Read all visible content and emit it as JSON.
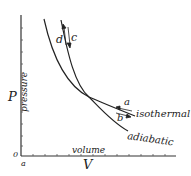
{
  "diagram": {
    "axes": {
      "y_label": "pressure",
      "y_symbol": "P",
      "x_label": "volume",
      "x_symbol": "V",
      "origin": "0",
      "x_origin_label": "a"
    },
    "curves": [
      {
        "name": "isothermal",
        "label": "isothermal"
      },
      {
        "name": "adiabatic",
        "label": "adiabatic"
      }
    ],
    "arrows": {
      "a": "a",
      "b": "b",
      "c": "c",
      "d": "d"
    },
    "colors": {
      "ink": "#222222",
      "background": "#ffffff"
    }
  }
}
